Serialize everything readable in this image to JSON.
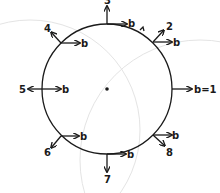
{
  "diagram": {
    "circle": {
      "cx": 107,
      "cy": 89,
      "r": 65
    },
    "center_dot": true,
    "points": [
      {
        "id": "1",
        "vector_label": "b=1",
        "number_label": ""
      },
      {
        "id": "2",
        "vector_label": "b",
        "number_label": "2"
      },
      {
        "id": "3",
        "vector_label": "b",
        "number_label": "3"
      },
      {
        "id": "4",
        "vector_label": "b",
        "number_label": "4"
      },
      {
        "id": "5",
        "vector_label": "b",
        "number_label": "5"
      },
      {
        "id": "6",
        "vector_label": "b",
        "number_label": "6"
      },
      {
        "id": "7",
        "vector_label": "b",
        "number_label": "7"
      },
      {
        "id": "8",
        "vector_label": "b",
        "number_label": "8"
      }
    ]
  }
}
